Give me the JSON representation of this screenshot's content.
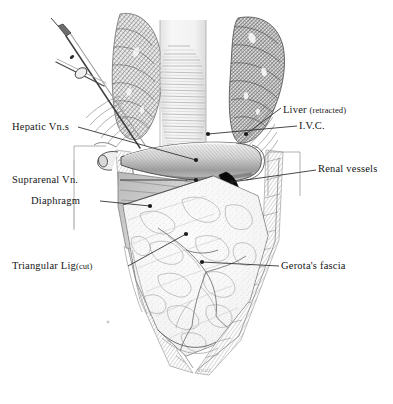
{
  "figure": {
    "background_color": "#ffffff",
    "ink_color": "#161616",
    "signature": "Anat."
  },
  "labels": {
    "hepatic_veins": "Hepatic Vn.s",
    "suprarenal_vein": "Suprarenal Vn.",
    "diaphragm": "Diaphragm",
    "triangular_ligament": "Triangular Lig",
    "triangular_ligament_note": "(cut)",
    "liver": "Liver",
    "liver_note": "(retracted)",
    "ivc": "I.V.C.",
    "renal_vessels": "Renal vessels",
    "gerota_fascia": "Gerota's fascia"
  },
  "structures": [
    {
      "name": "surgical-retractor",
      "note": "instrument at upper left"
    },
    {
      "name": "liver-retracted",
      "note": "dark cross-hatched mass upper right"
    },
    {
      "name": "vertebral-column",
      "note": "pale striated central column"
    },
    {
      "name": "inferior-vena-cava",
      "note": "horizontal tubular vessel"
    },
    {
      "name": "renal-vessel-crescent",
      "note": "solid black crescent"
    },
    {
      "name": "diaphragm-sheet",
      "note": "gray hatched triangle, left"
    },
    {
      "name": "gerota-fascia-mass",
      "note": "mottled kidney envelope"
    },
    {
      "name": "abdominal-wall",
      "note": "hatched V-shaped border"
    }
  ],
  "colors": {
    "ink": "#161616",
    "leader": "#2a2a2a",
    "bracket": "#8a8a8a",
    "tissue_light": "#f2f2f2",
    "tissue_mid": "#cfcfcf",
    "tissue_dark": "#7d7d7d",
    "vessel_black": "#0a0a0a",
    "signature": "#b8b8b8"
  }
}
